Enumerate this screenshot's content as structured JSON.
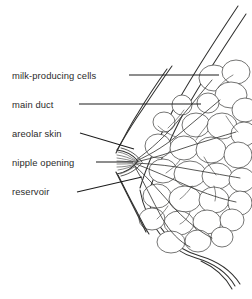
{
  "figure": {
    "background_color": "#ffffff",
    "ink_color": "#2b2b2b",
    "style": "stippled line drawing"
  },
  "labels": [
    {
      "id": "milk-producing-cells",
      "text": "milk-producing cells",
      "text_x": 12,
      "text_y": 79,
      "leader": {
        "x1": 129,
        "y1": 75,
        "x2": 219,
        "y2": 75
      }
    },
    {
      "id": "main-duct",
      "text": "main duct",
      "text_x": 12,
      "text_y": 108,
      "leader": {
        "x1": 79,
        "y1": 104,
        "x2": 201,
        "y2": 104
      }
    },
    {
      "id": "areolar-skin",
      "text": "areolar skin",
      "text_x": 12,
      "text_y": 137,
      "leader": {
        "x1": 80,
        "y1": 133,
        "x2": 134,
        "y2": 149
      }
    },
    {
      "id": "nipple-opening",
      "text": "nipple opening",
      "text_x": 12,
      "text_y": 166,
      "leader": {
        "x1": 96,
        "y1": 162,
        "x2": 133,
        "y2": 162
      }
    },
    {
      "id": "reservoir",
      "text": "reservoir",
      "text_x": 12,
      "text_y": 195,
      "leader": {
        "x1": 77,
        "y1": 192,
        "x2": 142,
        "y2": 177
      }
    }
  ],
  "anatomy": {
    "chest_wall_outer": "M 238,8 C 212,46 186,82 168,118 C 152,150 144,172 139,190",
    "chest_wall_inner": "M 245,16 C 220,54 195,90 177,126 C 161,158 152,180 147,196",
    "breast_underside": "M 139,196 C 146,228 168,252 196,260 C 214,265 228,272 236,284",
    "breast_underside_2": "M 146,200 C 153,230 173,250 199,257 C 217,262 231,270 240,282",
    "fold_line": "M 200,262 C 214,268 226,276 233,288",
    "nipple_x": 133,
    "nipple_y": 162
  }
}
